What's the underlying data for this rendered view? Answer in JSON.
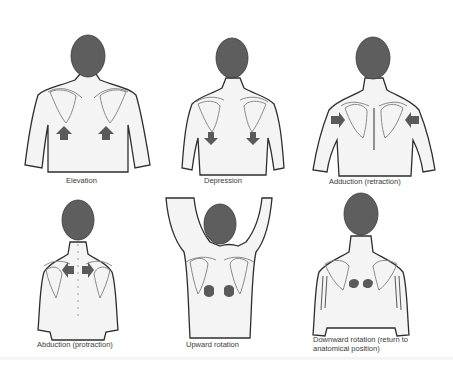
{
  "figure": {
    "colors": {
      "head": "#5e5e5e",
      "arrow": "#5a5a5a",
      "outline": "#2e2e2e",
      "scapula": "#8a8a8a",
      "skin": "#f4f4f4",
      "caption": "#3a3a3a"
    },
    "panels": [
      {
        "id": "elevation",
        "label": "Elevation",
        "arrow_direction": "up"
      },
      {
        "id": "depression",
        "label": "Depression",
        "arrow_direction": "down"
      },
      {
        "id": "adduction",
        "label": "Adduction (retraction)",
        "arrow_direction": "inward"
      },
      {
        "id": "abduction",
        "label": "Abduction (protraction)",
        "arrow_direction": "outward"
      },
      {
        "id": "upward-rotation",
        "label": "Upward rotation",
        "arrow_direction": "rotate-up"
      },
      {
        "id": "downward-rotation",
        "label": "Downward rotation (return to anatomical position)",
        "arrow_direction": "rotate-down"
      }
    ]
  }
}
